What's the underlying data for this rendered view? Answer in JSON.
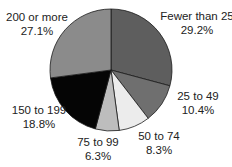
{
  "chart_data": {
    "type": "pie",
    "title": "",
    "start_angle_deg": 0,
    "direction": "clockwise",
    "center": [
      111,
      70
    ],
    "radius": 61,
    "slices": [
      {
        "label": "Fewer than 25",
        "value": 29.2,
        "value_text": "29.2%",
        "color": "#5e5e5e"
      },
      {
        "label": "25 to 49",
        "value": 10.4,
        "value_text": "10.4%",
        "color": "#6f6f6f"
      },
      {
        "label": "50 to 74",
        "value": 8.3,
        "value_text": "8.3%",
        "color": "#ececec"
      },
      {
        "label": "75 to 99",
        "value": 6.3,
        "value_text": "6.3%",
        "color": "#bdbdbd"
      },
      {
        "label": "150 to 199",
        "value": 18.8,
        "value_text": "18.8%",
        "color": "#050505"
      },
      {
        "label": "200 or more",
        "value": 27.1,
        "value_text": "27.1%",
        "color": "#8b8b8b"
      }
    ],
    "categories": [
      "Fewer than 25",
      "25 to 49",
      "50 to 74",
      "75 to 99",
      "150 to 199",
      "200 or more"
    ],
    "values": [
      29.2,
      10.4,
      8.3,
      6.3,
      18.8,
      27.1
    ],
    "legend": "none (direct labels)"
  },
  "labels": {
    "fewer_than_25": {
      "name": "Fewer than 25",
      "pct": "29.2%"
    },
    "25_to_49": {
      "name": "25 to 49",
      "pct": "10.4%"
    },
    "50_to_74": {
      "name": "50 to 74",
      "pct": "8.3%"
    },
    "75_to_99": {
      "name": "75 to 99",
      "pct": "6.3%"
    },
    "150_to_199": {
      "name": "150 to 199",
      "pct": "18.8%"
    },
    "200_or_more": {
      "name": "200 or more",
      "pct": "27.1%"
    }
  }
}
